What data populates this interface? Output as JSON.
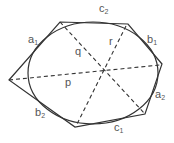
{
  "diagram": {
    "type": "hexagon circumscribed about ellipse with three diagonals (Brianchon configuration)",
    "colors": {
      "stroke": "#333333",
      "text": "#555555",
      "background": "#ffffff"
    },
    "ellipse": {
      "cx": 93,
      "cy": 73,
      "rx": 65,
      "ry": 51
    },
    "hexagon_vertices": [
      {
        "x": 9,
        "y": 80
      },
      {
        "x": 60,
        "y": 22
      },
      {
        "x": 128,
        "y": 24
      },
      {
        "x": 162,
        "y": 64
      },
      {
        "x": 145,
        "y": 114
      },
      {
        "x": 75,
        "y": 127
      }
    ],
    "diagonals": [
      {
        "name": "p",
        "x1": 9,
        "y1": 80,
        "x2": 160,
        "y2": 65
      },
      {
        "name": "q",
        "x1": 60,
        "y1": 22,
        "x2": 145,
        "y2": 114
      },
      {
        "name": "r",
        "x1": 126,
        "y1": 26,
        "x2": 76,
        "y2": 126
      }
    ],
    "center": {
      "x": 104,
      "y": 70
    },
    "labels": {
      "c2": {
        "base": "c",
        "sub": "2"
      },
      "a1": {
        "base": "a",
        "sub": "1"
      },
      "b1": {
        "base": "b",
        "sub": "1"
      },
      "q": {
        "base": "q",
        "sub": ""
      },
      "r": {
        "base": "r",
        "sub": ""
      },
      "p": {
        "base": "p",
        "sub": ""
      },
      "a2": {
        "base": "a",
        "sub": "2"
      },
      "b2": {
        "base": "b",
        "sub": "2"
      },
      "c1": {
        "base": "c",
        "sub": "1"
      }
    }
  }
}
